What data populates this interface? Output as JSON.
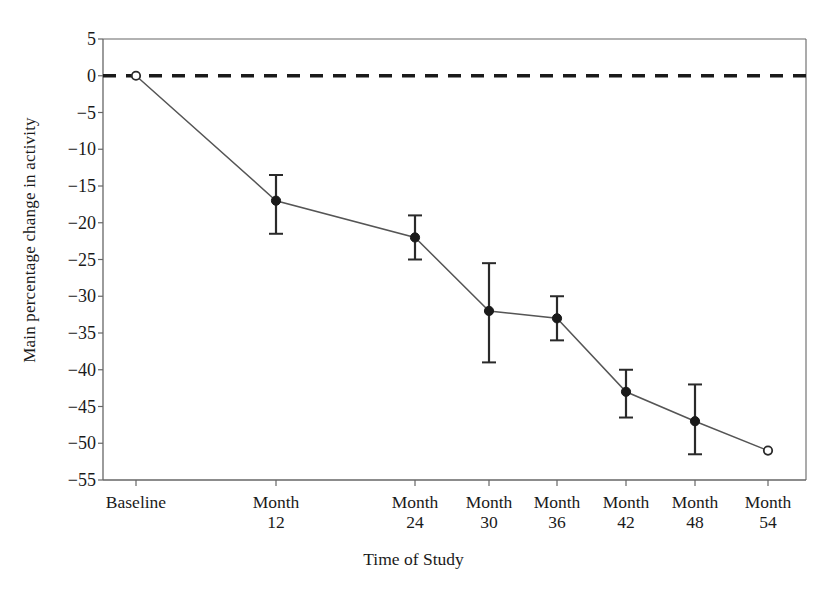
{
  "chart_data": {
    "type": "line",
    "title": "",
    "subtitle": "",
    "xlabel": "Time of Study",
    "ylabel": "Main percentage change in activity",
    "categories": [
      "Baseline",
      "Month 12",
      "Month 24",
      "Month 30",
      "Month 36",
      "Month 42",
      "Month 48",
      "Month 54"
    ],
    "xtick_labels": [
      {
        "line1": "Baseline",
        "line2": ""
      },
      {
        "line1": "Month",
        "line2": "12"
      },
      {
        "line1": "Month",
        "line2": "24"
      },
      {
        "line1": "Month",
        "line2": "30"
      },
      {
        "line1": "Month",
        "line2": "36"
      },
      {
        "line1": "Month",
        "line2": "42"
      },
      {
        "line1": "Month",
        "line2": "48"
      },
      {
        "line1": "Month",
        "line2": "54"
      }
    ],
    "values": [
      0,
      -17,
      -22,
      -32,
      -33,
      -43,
      -47,
      -51
    ],
    "error_low": [
      0,
      -21.5,
      -25,
      -39,
      -36,
      -46.5,
      -51.5,
      0
    ],
    "error_high": [
      0,
      -13.5,
      -19,
      -25.5,
      -30,
      -40,
      -42,
      0
    ],
    "has_error_bars": [
      false,
      true,
      true,
      true,
      true,
      true,
      true,
      false
    ],
    "marker_filled": [
      false,
      true,
      true,
      true,
      true,
      true,
      true,
      false
    ],
    "ylim": [
      -55,
      5
    ],
    "ytick_labels": [
      "5",
      "0",
      "−5",
      "−10",
      "−15",
      "−20",
      "−25",
      "−30",
      "−35",
      "−40",
      "−45",
      "−50",
      "−55"
    ],
    "ytick_values": [
      5,
      0,
      -5,
      -10,
      -15,
      -20,
      -25,
      -30,
      -35,
      -40,
      -45,
      -50,
      -55
    ],
    "grid": false,
    "legend": [],
    "legend_position": "none",
    "reference_line": {
      "value": 0,
      "style": "dashed",
      "color": "#1a1a1a"
    },
    "series_color": "#555555",
    "axis_color": "#666666",
    "annotations": []
  }
}
